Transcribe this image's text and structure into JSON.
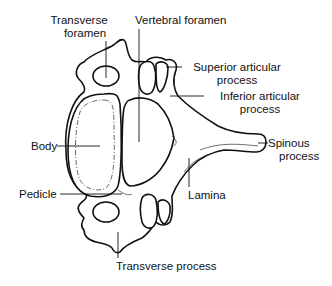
{
  "diagram": {
    "labels": {
      "transverse_foramen": {
        "line1": "Transverse",
        "line2": "foramen"
      },
      "vertebral_foramen": {
        "line1": "Vertebral foramen"
      },
      "superior_articular_process": {
        "line1": "Superior articular",
        "line2": "process"
      },
      "inferior_articular_process": {
        "line1": "Inferior articular",
        "line2": "process"
      },
      "body": {
        "line1": "Body"
      },
      "spinous_process": {
        "line1": "Spinous",
        "line2": "process"
      },
      "lamina": {
        "line1": "Lamina"
      },
      "pedicle": {
        "line1": "Pedicle"
      },
      "transverse_process": {
        "line1": "Transverse process"
      }
    },
    "colors": {
      "line": "#111111",
      "background": "#ffffff"
    }
  }
}
